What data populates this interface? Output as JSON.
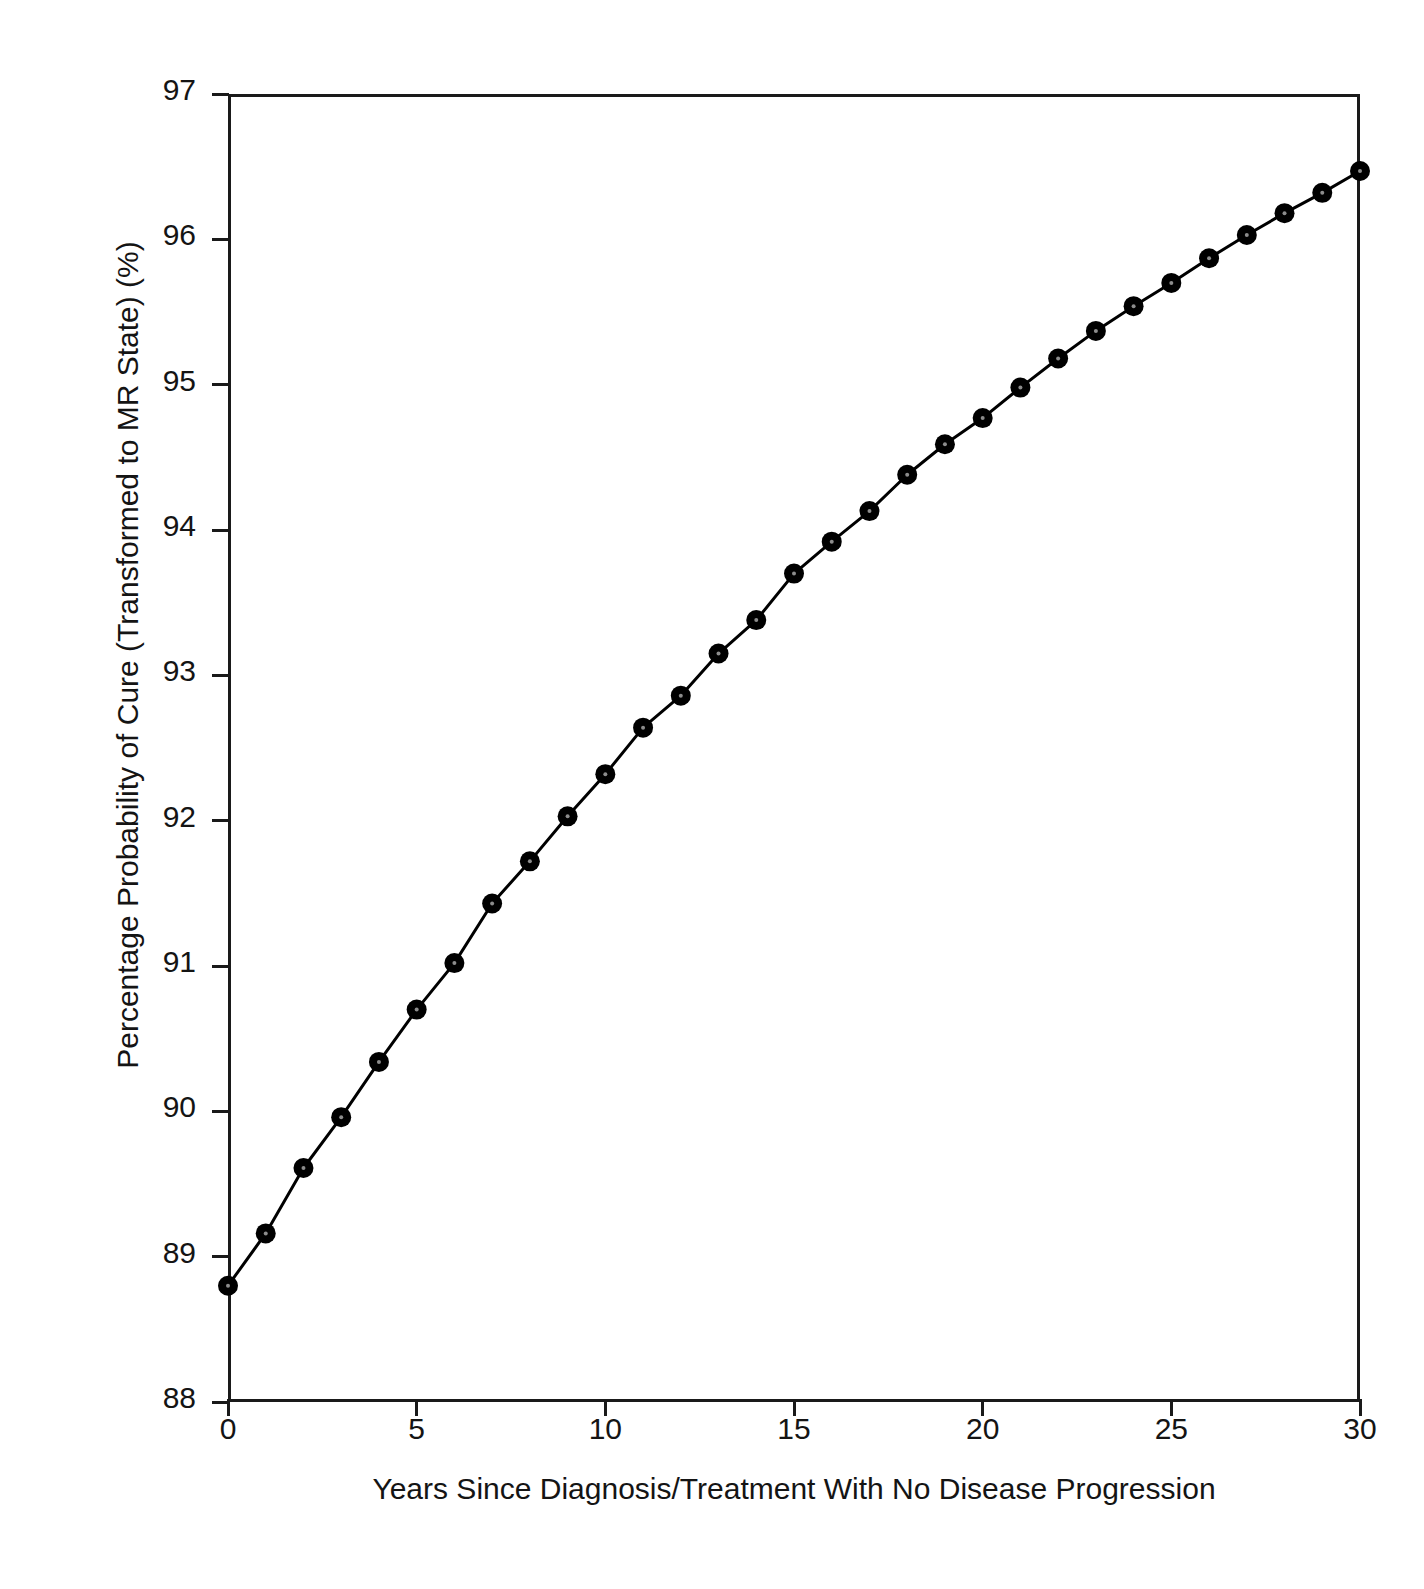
{
  "chart_data": {
    "type": "line",
    "title": "",
    "subtitle": "",
    "xlabel": "Years Since Diagnosis/Treatment With No Disease Progression",
    "ylabel": "Percentage Probability of Cure (Transformed to MR State) (%)",
    "xlim": [
      0,
      30
    ],
    "ylim": [
      88,
      97
    ],
    "xticks": [
      0,
      5,
      10,
      15,
      20,
      25,
      30
    ],
    "xtick_labels": [
      "0",
      "5",
      "10",
      "15",
      "20",
      "25",
      "30"
    ],
    "yticks": [
      88,
      89,
      90,
      91,
      92,
      93,
      94,
      95,
      96,
      97
    ],
    "ytick_labels": [
      "88",
      "89",
      "90",
      "91",
      "92",
      "93",
      "94",
      "95",
      "96",
      "97"
    ],
    "grid": false,
    "legend": null,
    "marker": "filled-circle",
    "marker_color": "#000000",
    "line_color": "#000000",
    "x": [
      0,
      1,
      2,
      3,
      4,
      5,
      6,
      7,
      8,
      9,
      10,
      11,
      12,
      13,
      14,
      15,
      16,
      17,
      18,
      19,
      20,
      21,
      22,
      23,
      24,
      25,
      26,
      27,
      28,
      29,
      30
    ],
    "y": [
      88.8,
      89.16,
      89.61,
      89.96,
      90.34,
      90.7,
      91.02,
      91.43,
      91.72,
      92.03,
      92.32,
      92.64,
      92.86,
      93.15,
      93.38,
      93.7,
      93.92,
      94.13,
      94.38,
      94.59,
      94.77,
      94.98,
      95.18,
      95.37,
      95.54,
      95.7,
      95.87,
      96.03,
      96.18,
      96.32,
      96.47
    ],
    "series": [
      {
        "name": "Percentage probability of cure",
        "values": [
          88.8,
          89.16,
          89.61,
          89.96,
          90.34,
          90.7,
          91.02,
          91.43,
          91.72,
          92.03,
          92.32,
          92.64,
          92.86,
          93.15,
          93.38,
          93.7,
          93.92,
          94.13,
          94.38,
          94.59,
          94.77,
          94.98,
          95.18,
          95.37,
          95.54,
          95.7,
          95.87,
          96.03,
          96.18,
          96.32,
          96.47
        ]
      }
    ]
  },
  "axes": {
    "y_title": "Percentage Probability of Cure (Transformed to MR State) (%)",
    "x_title": "Years Since Diagnosis/Treatment With No Disease Progression"
  },
  "colors": {
    "foreground": "#1a1a1a",
    "background": "#ffffff",
    "series": "#000000"
  }
}
